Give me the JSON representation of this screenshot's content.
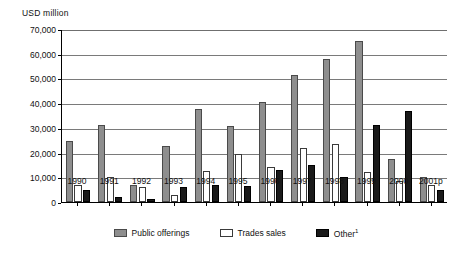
{
  "chart_data": {
    "type": "bar",
    "title": "",
    "ylabel": "USD million",
    "xlabel": "",
    "ylim": [
      0,
      70000
    ],
    "yticks": [
      0,
      10000,
      20000,
      30000,
      40000,
      50000,
      60000,
      70000
    ],
    "ytick_labels": [
      "0",
      "10,000",
      "20,000",
      "30,000",
      "40,000",
      "50,000",
      "60,000",
      "70,000"
    ],
    "grid": true,
    "legend_position": "bottom",
    "categories": [
      "1990",
      "1991",
      "1992",
      "1993",
      "1994",
      "1995",
      "1996",
      "1997",
      "1998",
      "1999",
      "2000",
      "2001p"
    ],
    "series": [
      {
        "name": "Public offerings",
        "color": "#8e8e8e",
        "values": [
          24500,
          31000,
          6800,
          22800,
          37800,
          30800,
          40500,
          51500,
          57800,
          65000,
          17500,
          10000
        ]
      },
      {
        "name": "Trades sales",
        "color": "#ffffff",
        "values": [
          7000,
          10000,
          6200,
          3000,
          12500,
          19500,
          14000,
          22000,
          23500,
          12000,
          8500,
          7000
        ]
      },
      {
        "name": "Other",
        "color": "#1a1a1a",
        "values": [
          4800,
          2200,
          1200,
          6000,
          6800,
          6500,
          13000,
          15000,
          10000,
          31000,
          37000,
          5000
        ],
        "footnote_marker": "1"
      }
    ]
  },
  "legend": {
    "items": [
      {
        "label": "Public offerings",
        "marker": ""
      },
      {
        "label": "Trades sales",
        "marker": ""
      },
      {
        "label": "Other",
        "marker": "1"
      }
    ]
  }
}
